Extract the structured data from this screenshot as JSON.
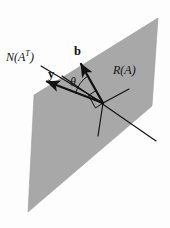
{
  "figure": {
    "background_color": "#fdfdfd",
    "plane": {
      "name": "range-plane",
      "fill_color": "#a8a8a8",
      "stroke_color": "#9a9a9a",
      "points": "158,18 152,106 28,212 34,95"
    },
    "labels": {
      "null_space_main": "N(A",
      "null_space_sup": "T",
      "null_space_close": ")",
      "range_space": "R(A)",
      "vector_b": "b",
      "vector_y": "y",
      "angle": "θ"
    },
    "lines": {
      "null_space_axis": {
        "x1": 38,
        "y1": 64,
        "x2": 103,
        "y2": 103
      },
      "vector_b": {
        "x1": 103,
        "y1": 103,
        "x2": 80,
        "y2": 62
      },
      "vector_y": {
        "x1": 103,
        "y1": 103,
        "x2": 45,
        "y2": 82
      },
      "range_axis_long": {
        "x1": 62,
        "y1": 76,
        "x2": 156,
        "y2": 141
      },
      "range_axis_short": {
        "x1": 103,
        "y1": 103,
        "x2": 129,
        "y2": 89
      },
      "projection_drop": {
        "x1": 103,
        "y1": 103,
        "x2": 98,
        "y2": 136
      }
    },
    "right_angle_marker": {
      "points": "88,95 96,90 103,103 95,108"
    },
    "angle_arc": {
      "center_x": 103,
      "center_y": 103,
      "radius": 33
    },
    "colors": {
      "ink": "#111111",
      "plane_gray": "#a8a8a8"
    }
  }
}
